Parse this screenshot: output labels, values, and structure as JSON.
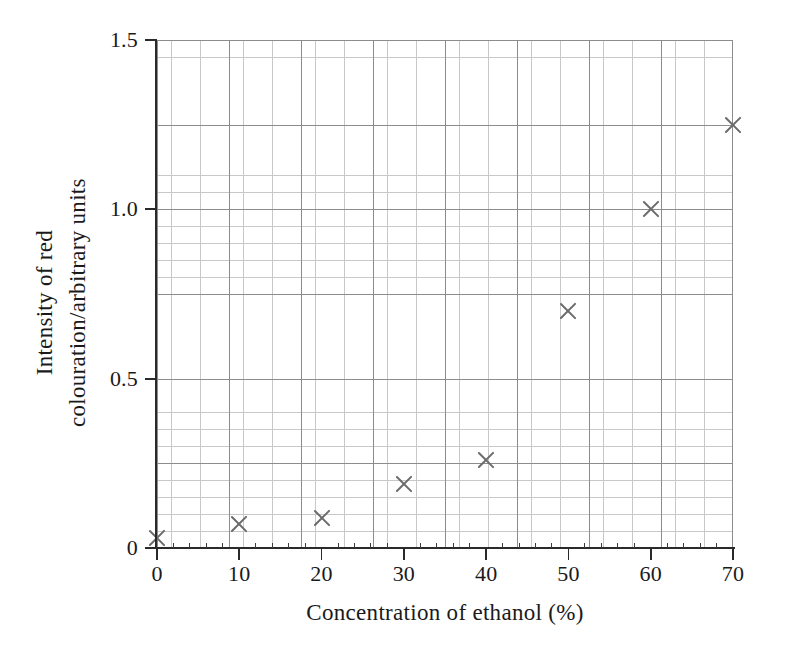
{
  "chart_data": {
    "type": "scatter",
    "title": "",
    "xlabel": "Concentration of ethanol (%)",
    "ylabel": "Intensity of red colouration/arbitrary units",
    "ylabel_lines": [
      "Intensity of red",
      "colouration/arbitrary units"
    ],
    "xlim": [
      0,
      70
    ],
    "ylim": [
      0,
      1.5
    ],
    "xticks": [
      0,
      10,
      20,
      30,
      40,
      50,
      60,
      70
    ],
    "xticklabels": [
      "0",
      "10",
      "20",
      "30",
      "40",
      "50",
      "60",
      "70"
    ],
    "yticks": [
      0,
      0.5,
      1.0,
      1.5
    ],
    "yticklabels": [
      "0",
      "0.5",
      "1.0",
      "1.5"
    ],
    "grid": true,
    "grid_minor": true,
    "legend": "none",
    "marker": "x",
    "marker_color": "#6b6b6b",
    "x": [
      0,
      10,
      20,
      30,
      40,
      50,
      60,
      70
    ],
    "y": [
      0.03,
      0.07,
      0.09,
      0.19,
      0.26,
      0.7,
      1.0,
      1.25
    ],
    "points": [
      {
        "x": 0,
        "y": 0.03
      },
      {
        "x": 10,
        "y": 0.07
      },
      {
        "x": 20,
        "y": 0.09
      },
      {
        "x": 30,
        "y": 0.19
      },
      {
        "x": 40,
        "y": 0.26
      },
      {
        "x": 50,
        "y": 0.7
      },
      {
        "x": 60,
        "y": 1.0
      },
      {
        "x": 70,
        "y": 1.25
      }
    ]
  },
  "colors": {
    "marker": "#6b6b6b",
    "axis": "#2a2a2a",
    "grid_major": "#8c8c8c",
    "grid_minor": "#c8c8c8",
    "background": "#ffffff"
  }
}
